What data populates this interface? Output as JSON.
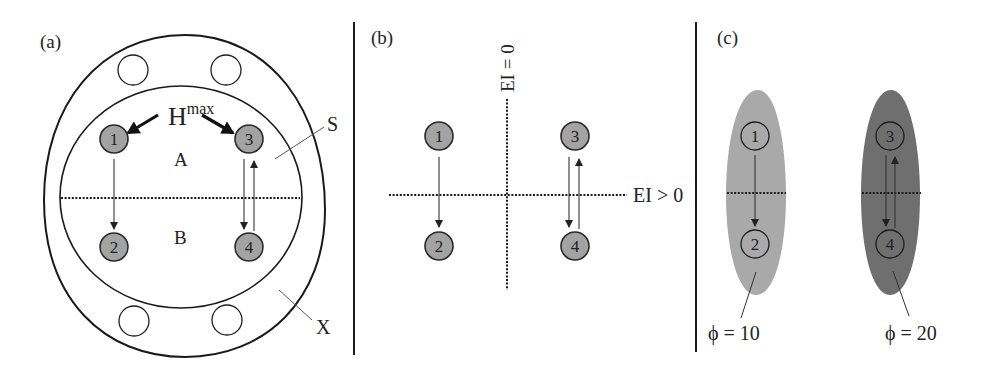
{
  "panels": {
    "a": {
      "label": "(a)",
      "hmax_base": "H",
      "hmax_sup": "max",
      "region_top": "A",
      "region_bottom": "B",
      "callout_s": "S",
      "callout_x": "X",
      "nodes": [
        "1",
        "2",
        "3",
        "4"
      ]
    },
    "b": {
      "label": "(b)",
      "axis_vertical": "EI = 0",
      "axis_horizontal": "EI > 0",
      "nodes": [
        "1",
        "2",
        "3",
        "4"
      ]
    },
    "c": {
      "label": "(c)",
      "left_caption": "ϕ = 10",
      "right_caption": "ϕ = 20",
      "nodes": [
        "1",
        "2",
        "3",
        "4"
      ]
    }
  },
  "colors": {
    "node_fill": "#a3a3a3",
    "ellipse_light": "#a9a9a9",
    "ellipse_dark": "#6f6f6f",
    "line": "#1a1a1a"
  }
}
